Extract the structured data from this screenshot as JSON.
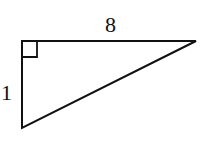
{
  "diagram": {
    "type": "right-triangle",
    "vertices": {
      "right_angle": [
        22,
        41
      ],
      "top_right": [
        196,
        41
      ],
      "bottom_left": [
        22,
        128
      ]
    },
    "labels": {
      "top_side": "8",
      "left_side": "1"
    },
    "right_angle_marker": true,
    "stroke_color": "#111111",
    "background_color": "#ffffff"
  }
}
